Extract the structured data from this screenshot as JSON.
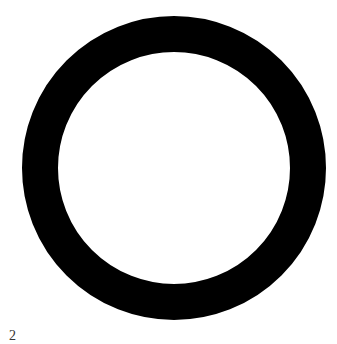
{
  "figure": {
    "shape": "ring",
    "ring_color": "#000000",
    "background_color": "#ffffff",
    "label": "2"
  }
}
